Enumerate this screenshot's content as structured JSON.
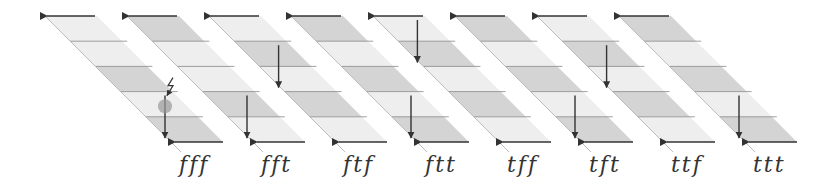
{
  "diagram": {
    "colors": {
      "dark_band": "#d4d4d4",
      "light_band": "#eeeeee",
      "edge": "#bbbbbb",
      "arrow": "#333333",
      "thin_line": "#888888",
      "marker": "#999999"
    },
    "panels": [
      {
        "label": "fff",
        "bands": [
          "light",
          "light",
          "dark",
          "light",
          "dark"
        ],
        "down_arrow_band": 3,
        "fault": true
      },
      {
        "label": "fft",
        "bands": [
          "dark",
          "light",
          "light",
          "dark",
          "light"
        ],
        "down_arrow_band": 3,
        "fault": false
      },
      {
        "label": "ftf",
        "bands": [
          "light",
          "dark",
          "light",
          "dark",
          "light"
        ],
        "down_arrow_band": 1,
        "fault": false
      },
      {
        "label": "ftt",
        "bands": [
          "dark",
          "light",
          "dark",
          "light",
          "dark"
        ],
        "down_arrow_band": 3,
        "fault": false
      },
      {
        "label": "tff",
        "bands": [
          "light",
          "dark",
          "light",
          "dark",
          "light"
        ],
        "down_arrow_band": 0,
        "fault": false
      },
      {
        "label": "tft",
        "bands": [
          "dark",
          "light",
          "dark",
          "light",
          "dark"
        ],
        "down_arrow_band": 3,
        "fault": false
      },
      {
        "label": "ttf",
        "bands": [
          "light",
          "dark",
          "light",
          "dark",
          "light"
        ],
        "down_arrow_band": 1,
        "fault": false
      },
      {
        "label": "ttt",
        "bands": [
          "dark",
          "light",
          "dark",
          "light",
          "dark"
        ],
        "down_arrow_band": 3,
        "fault": false
      }
    ]
  }
}
